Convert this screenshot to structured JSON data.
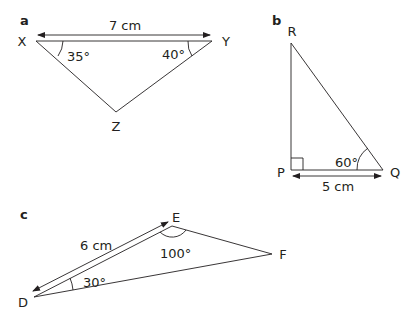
{
  "diagrams": [
    {
      "part": "a",
      "vertices": [
        "X",
        "Y",
        "Z"
      ],
      "side_label": "7 cm",
      "angles": {
        "X": "35°",
        "Y": "40°"
      }
    },
    {
      "part": "b",
      "vertices": [
        "R",
        "P",
        "Q"
      ],
      "side_label": "5 cm",
      "angles": {
        "Q": "60°"
      },
      "right_angle_at": "P"
    },
    {
      "part": "c",
      "vertices": [
        "E",
        "F",
        "D"
      ],
      "side_label": "6 cm",
      "angles": {
        "E": "100°",
        "D": "30°"
      }
    }
  ]
}
